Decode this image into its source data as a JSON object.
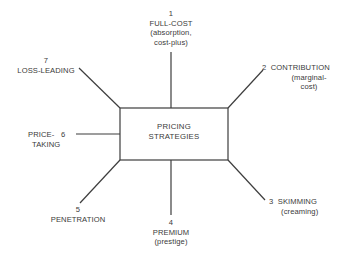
{
  "center": {
    "line1": "PRICING",
    "line2": "STRATEGIES"
  },
  "strategies": [
    {
      "number": "1",
      "name": "FULL-COST",
      "sub1": "(absorption,",
      "sub2": "cost-plus)"
    },
    {
      "number": "2",
      "name": "CONTRIBUTION",
      "sub1": "(marginal-",
      "sub2": "cost)"
    },
    {
      "number": "3",
      "name": "SKIMMING",
      "sub1": "(creaming)"
    },
    {
      "number": "4",
      "name": "PREMIUM",
      "sub1": "(prestige)"
    },
    {
      "number": "5",
      "name": "PENETRATION"
    },
    {
      "number": "6",
      "name1": "PRICE-",
      "name2": "TAKING"
    },
    {
      "number": "7",
      "name": "LOSS-LEADING"
    }
  ]
}
